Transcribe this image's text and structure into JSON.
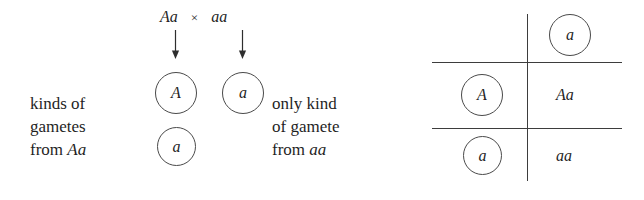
{
  "figure": {
    "title": "Monohybrid testcross Aa x aa gamete and Punnett square diagram",
    "ink_color": "#1f1f1f",
    "rule_color": "#3d3d3d",
    "circle_stroke": "#4a4a4a",
    "background": "#ffffff"
  },
  "cross": {
    "parent_left": "Aa",
    "operator": "×",
    "parent_right": "aa"
  },
  "labels": {
    "left": {
      "line1": "kinds of",
      "line2": "gametes",
      "line3_prefix": "from ",
      "line3_italic": "Aa"
    },
    "middle": {
      "line1": "only kind",
      "line2": "of gamete",
      "line3_prefix": "from ",
      "line3_italic": "aa"
    }
  },
  "gametes": {
    "left_parent": [
      {
        "allele": "A"
      },
      {
        "allele": "a"
      }
    ],
    "right_parent": [
      {
        "allele": "a"
      }
    ]
  },
  "punnett": {
    "column_header": {
      "allele": "a"
    },
    "row_headers": [
      {
        "allele": "A"
      },
      {
        "allele": "a"
      }
    ],
    "cells": [
      {
        "genotype": "Aa"
      },
      {
        "genotype": "aa"
      }
    ]
  },
  "icons": {
    "down_arrow": "arrow-down-icon"
  }
}
